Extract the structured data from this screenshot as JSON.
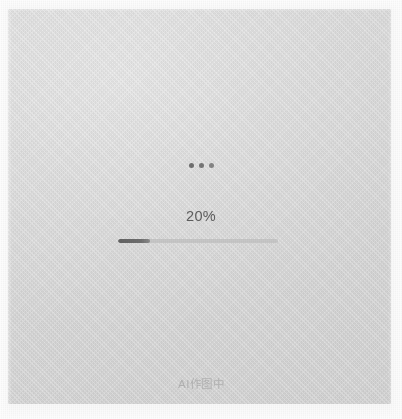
{
  "card": {
    "background_color": "#d9d9d9",
    "page_background_color": "#f8f8f8"
  },
  "loading_indicator": {
    "dots": [
      "dot-1",
      "dot-2",
      "dot-3"
    ],
    "dot_color": "#6f6f6f"
  },
  "progress": {
    "percent_label": "20%",
    "value": 20,
    "min": 0,
    "max": 100,
    "fill_color": "#636363",
    "track_color": "#c6c6c6"
  },
  "status": {
    "label": "AI作图中",
    "color": "#b2b2b2"
  }
}
